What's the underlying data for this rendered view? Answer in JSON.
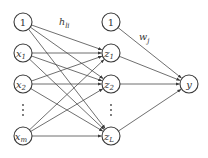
{
  "diagram": {
    "type": "neural-network",
    "colors": {
      "stroke": "#3a3a3a",
      "edge": "#4a4a4a",
      "text": "#333333",
      "background": "#ffffff"
    },
    "layers": {
      "input": {
        "nodes": [
          {
            "id": "in_bias",
            "label": "1",
            "sub": "",
            "cx": 23,
            "cy": 22
          },
          {
            "id": "x1",
            "label": "x",
            "sub": "1",
            "cx": 23,
            "cy": 53
          },
          {
            "id": "x2",
            "label": "x",
            "sub": "2",
            "cx": 23,
            "cy": 84
          },
          {
            "id": "xm",
            "label": "x",
            "sub": "m",
            "cx": 23,
            "cy": 136
          }
        ],
        "ellipsis": {
          "x": 23,
          "y": 110
        }
      },
      "hidden": {
        "nodes": [
          {
            "id": "hid_bias",
            "label": "1",
            "sub": "",
            "cx": 111,
            "cy": 22
          },
          {
            "id": "z1",
            "label": "z",
            "sub": "1",
            "cx": 111,
            "cy": 53
          },
          {
            "id": "z2",
            "label": "z",
            "sub": "2",
            "cx": 111,
            "cy": 84
          },
          {
            "id": "zL",
            "label": "z",
            "sub": "L",
            "cx": 111,
            "cy": 136
          }
        ],
        "ellipsis": {
          "x": 111,
          "y": 110
        }
      },
      "output": {
        "nodes": [
          {
            "id": "y",
            "label": "y",
            "sub": "",
            "cx": 189,
            "cy": 84
          }
        ]
      }
    },
    "edges": [
      [
        "in_bias",
        "z1"
      ],
      [
        "in_bias",
        "z2"
      ],
      [
        "in_bias",
        "zL"
      ],
      [
        "x1",
        "z1"
      ],
      [
        "x1",
        "z2"
      ],
      [
        "x1",
        "zL"
      ],
      [
        "x2",
        "z1"
      ],
      [
        "x2",
        "z2"
      ],
      [
        "x2",
        "zL"
      ],
      [
        "xm",
        "z1"
      ],
      [
        "xm",
        "z2"
      ],
      [
        "xm",
        "zL"
      ],
      [
        "hid_bias",
        "y"
      ],
      [
        "z1",
        "y"
      ],
      [
        "z2",
        "y"
      ],
      [
        "zL",
        "y"
      ]
    ],
    "weight_labels": [
      {
        "id": "h",
        "text": "h",
        "sub": "li",
        "x": 59,
        "y": 25
      },
      {
        "id": "w",
        "text": "w",
        "sub": "j",
        "x": 139,
        "y": 40
      }
    ],
    "node_radius": 9
  }
}
